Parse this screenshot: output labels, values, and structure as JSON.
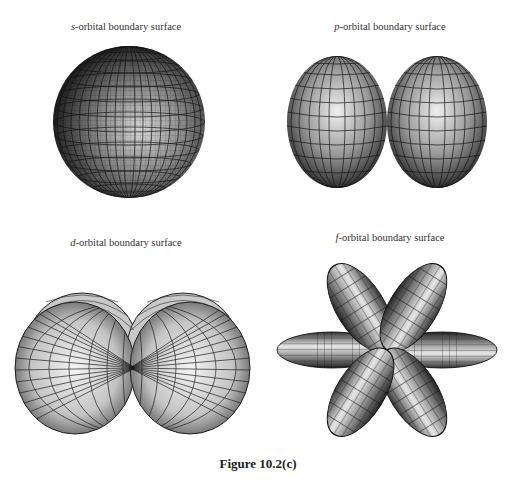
{
  "panels": [
    {
      "id": "s",
      "letter": "s",
      "label_suffix": "-orbital boundary surface",
      "label_x": 126,
      "label_y": 21
    },
    {
      "id": "p",
      "letter": "p",
      "label_suffix": "-orbital boundary surface",
      "label_x": 390,
      "label_y": 21
    },
    {
      "id": "d",
      "letter": "d",
      "label_suffix": "-orbital boundary surface",
      "label_x": 126,
      "label_y": 237
    },
    {
      "id": "f",
      "letter": "f",
      "label_suffix": "-orbital boundary surface",
      "label_x": 390,
      "label_y": 232
    }
  ],
  "caption": "Figure 10.2(c)",
  "colors": {
    "mesh_line": "#1a1a1a",
    "highlight": "#e8e8e8",
    "shadow": "#2a2a2a",
    "background": "#ffffff"
  }
}
